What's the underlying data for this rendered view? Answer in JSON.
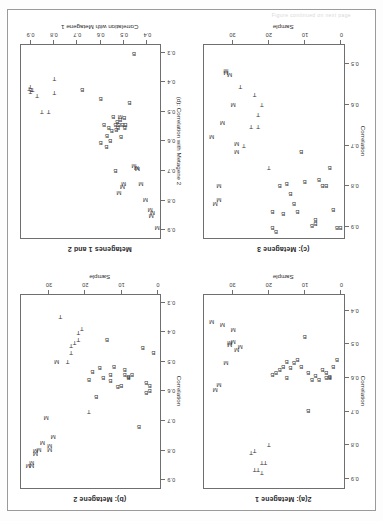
{
  "page": {
    "top_caption": "Figure continued on next page",
    "background": "#ffffff",
    "frame_color": "#9a9a9a",
    "point_color": "#3a3a3a",
    "orientation": "rotated-180"
  },
  "panels": [
    {
      "id": "panel-a",
      "title": "2(a): Metagene 1",
      "xlabel": "Sample",
      "ylabel": "Correlation",
      "xticks": [
        0,
        10,
        20,
        30
      ],
      "yticks": [
        "0.4",
        "0.5",
        "0.6",
        "0.7",
        "0.8",
        "0.9"
      ],
      "xlim": [
        -1,
        38
      ],
      "ylim": [
        0.35,
        0.93
      ],
      "chart_data": {
        "type": "scatter",
        "title": "2(a): Metagene 1",
        "xlabel": "Sample",
        "ylabel": "Correlation",
        "xlim": [
          -1,
          38
        ],
        "ylim": [
          0.35,
          0.93
        ],
        "grid": false,
        "legend": "none",
        "series": [
          {
            "name": "B",
            "marker": "B",
            "points": [
              [
                1,
                0.545
              ],
              [
                2,
                0.565
              ],
              [
                3,
                0.595
              ],
              [
                3,
                0.6
              ],
              [
                4,
                0.585
              ],
              [
                4,
                0.6
              ],
              [
                5,
                0.575
              ],
              [
                6,
                0.605
              ],
              [
                7,
                0.592
              ],
              [
                8,
                0.605
              ],
              [
                9,
                0.585
              ],
              [
                9,
                0.7
              ],
              [
                10,
                0.475
              ],
              [
                11,
                0.565
              ],
              [
                12,
                0.545
              ],
              [
                13,
                0.555
              ],
              [
                14,
                0.568
              ],
              [
                15,
                0.552
              ],
              [
                15,
                0.6
              ],
              [
                16,
                0.565
              ],
              [
                17,
                0.575
              ],
              [
                18,
                0.585
              ],
              [
                19,
                0.59
              ]
            ]
          },
          {
            "name": "T",
            "marker": "T",
            "points": [
              [
                20,
                0.8
              ],
              [
                21,
                0.855
              ],
              [
                22,
                0.855
              ],
              [
                22,
                0.885
              ],
              [
                23,
                0.875
              ],
              [
                24,
                0.875
              ],
              [
                24,
                0.82
              ],
              [
                25,
                0.825
              ]
            ]
          },
          {
            "name": "M",
            "marker": "M",
            "points": [
              [
                28,
                0.505
              ],
              [
                29,
                0.515
              ],
              [
                30,
                0.49
              ],
              [
                30,
                0.455
              ],
              [
                31,
                0.5
              ],
              [
                31,
                0.495
              ],
              [
                32,
                0.555
              ],
              [
                33,
                0.44
              ],
              [
                34,
                0.62
              ],
              [
                35,
                0.635
              ],
              [
                36,
                0.43
              ]
            ]
          }
        ]
      }
    },
    {
      "id": "panel-b",
      "title": "(b): Metagene 2",
      "xlabel": "Sample",
      "ylabel": "Correlation",
      "xticks": [
        0,
        10,
        20,
        30
      ],
      "yticks": [
        "0.3",
        "0.4",
        "0.5",
        "0.6",
        "0.7",
        "0.8",
        "0.9"
      ],
      "xlim": [
        -1,
        38
      ],
      "ylim": [
        0.27,
        0.93
      ],
      "chart_data": {
        "type": "scatter",
        "title": "(b): Metagene 2",
        "xlabel": "Sample",
        "ylabel": "Correlation",
        "xlim": [
          -1,
          38
        ],
        "ylim": [
          0.27,
          0.93
        ],
        "grid": false,
        "legend": "none",
        "series": [
          {
            "name": "B",
            "marker": "B",
            "points": [
              [
                1,
                0.47
              ],
              [
                2,
                0.58
              ],
              [
                2,
                0.6
              ],
              [
                3,
                0.605
              ],
              [
                3,
                0.57
              ],
              [
                4,
                0.45
              ],
              [
                5,
                0.72
              ],
              [
                7,
                0.545
              ],
              [
                8,
                0.55
              ],
              [
                8,
                0.555
              ],
              [
                9,
                0.525
              ],
              [
                9,
                0.545
              ],
              [
                10,
                0.58
              ],
              [
                11,
                0.585
              ],
              [
                12,
                0.515
              ],
              [
                13,
                0.565
              ],
              [
                13,
                0.545
              ],
              [
                14,
                0.425
              ],
              [
                15,
                0.555
              ],
              [
                16,
                0.52
              ],
              [
                17,
                0.62
              ],
              [
                18,
                0.535
              ],
              [
                19,
                0.56
              ]
            ]
          },
          {
            "name": "T",
            "marker": "T",
            "points": [
              [
                19,
                0.67
              ],
              [
                21,
                0.385
              ],
              [
                22,
                0.4
              ],
              [
                22,
                0.425
              ],
              [
                23,
                0.435
              ],
              [
                24,
                0.445
              ],
              [
                24,
                0.47
              ],
              [
                25,
                0.5
              ],
              [
                27,
                0.345
              ]
            ]
          },
          {
            "name": "M",
            "marker": "M",
            "points": [
              [
                28,
                0.5
              ],
              [
                29,
                0.755
              ],
              [
                30,
                0.785
              ],
              [
                30,
                0.8
              ],
              [
                31,
                0.69
              ],
              [
                32,
                0.775
              ],
              [
                33,
                0.8
              ],
              [
                34,
                0.805
              ],
              [
                34,
                0.815
              ],
              [
                35,
                0.845
              ],
              [
                35,
                0.855
              ],
              [
                36,
                0.855
              ]
            ]
          }
        ]
      }
    },
    {
      "id": "panel-c",
      "title": "(c): Metagene 3",
      "xlabel": "Sample",
      "ylabel": "Correlation",
      "xticks": [
        0,
        10,
        20,
        30
      ],
      "yticks": [
        "0.5",
        "0.6",
        "0.7",
        "0.8",
        "0.9"
      ],
      "xlim": [
        -1,
        38
      ],
      "ylim": [
        0.45,
        0.93
      ],
      "chart_data": {
        "type": "scatter",
        "title": "(c): Metagene 3",
        "xlabel": "Sample",
        "ylabel": "Correlation",
        "xlim": [
          -1,
          38
        ],
        "ylim": [
          0.45,
          0.93
        ],
        "grid": false,
        "legend": "none",
        "series": [
          {
            "name": "B",
            "marker": "B",
            "points": [
              [
                0,
                0.905
              ],
              [
                1,
                0.905
              ],
              [
                2,
                0.86
              ],
              [
                3,
                0.755
              ],
              [
                4,
                0.8
              ],
              [
                5,
                0.8
              ],
              [
                6,
                0.785
              ],
              [
                7,
                0.895
              ],
              [
                7,
                0.885
              ],
              [
                8,
                0.9
              ],
              [
                10,
                0.79
              ],
              [
                11,
                0.715
              ],
              [
                12,
                0.865
              ],
              [
                13,
                0.845
              ],
              [
                14,
                0.82
              ],
              [
                15,
                0.795
              ],
              [
                16,
                0.87
              ],
              [
                17,
                0.8
              ],
              [
                18,
                0.915
              ],
              [
                19,
                0.905
              ],
              [
                19,
                0.865
              ]
            ]
          },
          {
            "name": "T",
            "marker": "T",
            "points": [
              [
                20,
                0.755
              ],
              [
                22,
                0.6
              ],
              [
                23,
                0.625
              ],
              [
                23,
                0.655
              ],
              [
                24,
                0.575
              ],
              [
                25,
                0.655
              ],
              [
                27,
                0.7
              ],
              [
                28,
                0.555
              ]
            ]
          },
          {
            "name": "M",
            "marker": "M",
            "points": [
              [
                29,
                0.715
              ],
              [
                29,
                0.695
              ],
              [
                30,
                0.6
              ],
              [
                31,
                0.525
              ],
              [
                32,
                0.52
              ],
              [
                32,
                0.515
              ],
              [
                33,
                0.645
              ],
              [
                34,
                0.8
              ],
              [
                34,
                0.835
              ],
              [
                35,
                0.845
              ],
              [
                36,
                0.68
              ]
            ]
          }
        ]
      }
    },
    {
      "id": "panel-d",
      "title": "Metagenes 1 and 2",
      "xlabel": "Correlation with Metagene 1",
      "ylabel": "(d): Correlation with Metagene 2",
      "xticks": [
        "0.4",
        "0.5",
        "0.6",
        "0.7",
        "0.8",
        "0.9"
      ],
      "yticks": [
        "0.3",
        "0.4",
        "0.5",
        "0.6",
        "0.7",
        "0.8",
        "0.9"
      ],
      "xlim": [
        0.34,
        0.945
      ],
      "ylim": [
        0.27,
        0.93
      ],
      "chart_data": {
        "type": "scatter",
        "title": "Metagenes 1 and 2",
        "xlabel": "Correlation with Metagene 1",
        "ylabel": "(d): Correlation with Metagene 2",
        "xlim": [
          0.34,
          0.945
        ],
        "ylim": [
          0.27,
          0.93
        ],
        "grid": false,
        "legend": "none",
        "series": [
          {
            "name": "B",
            "marker": "B",
            "points": [
              [
                0.475,
                0.47
              ],
              [
                0.492,
                0.545
              ],
              [
                0.495,
                0.555
              ],
              [
                0.498,
                0.52
              ],
              [
                0.505,
                0.545
              ],
              [
                0.512,
                0.585
              ],
              [
                0.515,
                0.525
              ],
              [
                0.52,
                0.545
              ],
              [
                0.525,
                0.555
              ],
              [
                0.528,
                0.535
              ],
              [
                0.532,
                0.56
              ],
              [
                0.535,
                0.545
              ],
              [
                0.545,
                0.515
              ],
              [
                0.552,
                0.565
              ],
              [
                0.558,
                0.6
              ],
              [
                0.565,
                0.555
              ],
              [
                0.572,
                0.58
              ],
              [
                0.575,
                0.62
              ],
              [
                0.585,
                0.545
              ],
              [
                0.6,
                0.605
              ],
              [
                0.535,
                0.7
              ],
              [
                0.6,
                0.455
              ],
              [
                0.68,
                0.425
              ],
              [
                0.455,
                0.3
              ]
            ]
          },
          {
            "name": "T",
            "marker": "T",
            "points": [
              [
                0.8,
                0.435
              ],
              [
                0.8,
                0.385
              ],
              [
                0.825,
                0.5
              ],
              [
                0.855,
                0.5
              ],
              [
                0.875,
                0.445
              ],
              [
                0.895,
                0.425
              ],
              [
                0.9,
                0.425
              ],
              [
                0.905,
                0.415
              ],
              [
                0.905,
                0.43
              ],
              [
                0.91,
                0.42
              ]
            ]
          },
          {
            "name": "M",
            "marker": "M",
            "points": [
              [
                0.355,
                0.895
              ],
              [
                0.375,
                0.845
              ],
              [
                0.38,
                0.855
              ],
              [
                0.385,
                0.835
              ],
              [
                0.405,
                0.8
              ],
              [
                0.425,
                0.745
              ],
              [
                0.44,
                0.695
              ],
              [
                0.445,
                0.69
              ],
              [
                0.455,
                0.685
              ],
              [
                0.5,
                0.745
              ],
              [
                0.505,
                0.755
              ],
              [
                0.52,
                0.775
              ],
              [
                0.515,
                0.515
              ]
            ]
          }
        ]
      }
    }
  ]
}
